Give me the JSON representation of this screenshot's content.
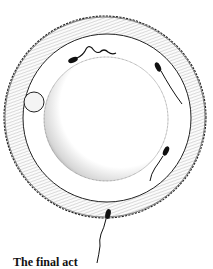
{
  "figure": {
    "parts": {
      "outer_layer": "corona-radiata",
      "zona": "zona-pellucida",
      "egg": "ovum",
      "polar_body": "polar-body",
      "sperm_count": 4
    },
    "colors": {
      "ink": "#111111",
      "background": "#ffffff",
      "stipple": "#555555"
    }
  },
  "caption": {
    "text": "The final act"
  }
}
